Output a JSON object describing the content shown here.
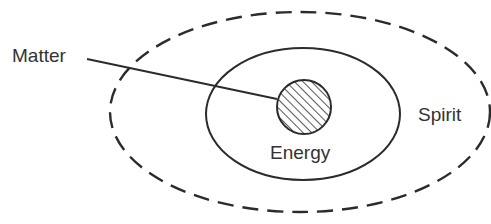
{
  "diagram": {
    "type": "nested-ellipses",
    "colors": {
      "stroke": "#2b2b2b",
      "text": "#333333",
      "background": "#ffffff"
    },
    "labels": {
      "matter": "Matter",
      "energy": "Energy",
      "spirit": "Spirit"
    },
    "shapes": {
      "outer": {
        "name": "Spirit",
        "style": "dashed",
        "cx": 300,
        "cy": 112,
        "rx": 190,
        "ry": 100
      },
      "middle": {
        "name": "Energy",
        "style": "solid",
        "cx": 303,
        "cy": 114,
        "rx": 97,
        "ry": 66
      },
      "core": {
        "name": "Matter",
        "style": "hatched",
        "cx": 304,
        "cy": 107,
        "r": 27
      }
    },
    "leader_line": {
      "from_label": "Matter",
      "x1": 87,
      "y1": 59,
      "x2": 277,
      "y2": 99
    }
  }
}
